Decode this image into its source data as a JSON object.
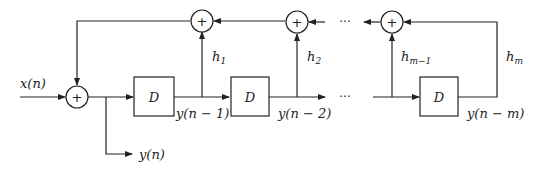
{
  "diagram": {
    "type": "IIR filter block diagram (feedback delay line)",
    "input_label": "x(n)",
    "output_label": "y(n)",
    "adder_symbol": "+",
    "delay_symbol": "D",
    "ellipsis": "···",
    "delay_outputs": [
      "y(n − 1)",
      "y(n − 2)",
      "y(n − m)"
    ],
    "gains": [
      {
        "base": "h",
        "sub": "1"
      },
      {
        "base": "h",
        "sub": "2"
      },
      {
        "base": "h",
        "sub": "m−1"
      },
      {
        "base": "h",
        "sub": "m"
      }
    ]
  }
}
